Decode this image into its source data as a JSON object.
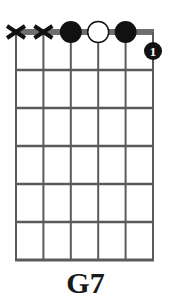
{
  "chord": {
    "name": "G7",
    "num_strings": 6,
    "num_frets": 6,
    "string_states": [
      "x",
      "x",
      "fretted",
      "open",
      "fretted",
      "fretted"
    ],
    "nut_markers": [
      {
        "string": 1,
        "type": "muted",
        "symbol": "X"
      },
      {
        "string": 2,
        "type": "muted",
        "symbol": "X"
      },
      {
        "string": 3,
        "type": "filled-dot"
      },
      {
        "string": 4,
        "type": "open-dot"
      },
      {
        "string": 5,
        "type": "filled-dot"
      }
    ],
    "finger_dots": [
      {
        "string": 6,
        "fret": 1,
        "finger": "1"
      }
    ]
  },
  "colors": {
    "line": "#5a5a5a",
    "nut": "#6e6e6e",
    "dot": "#111111",
    "dot_text": "#ffffff",
    "open_dot_fill": "#ffffff"
  }
}
